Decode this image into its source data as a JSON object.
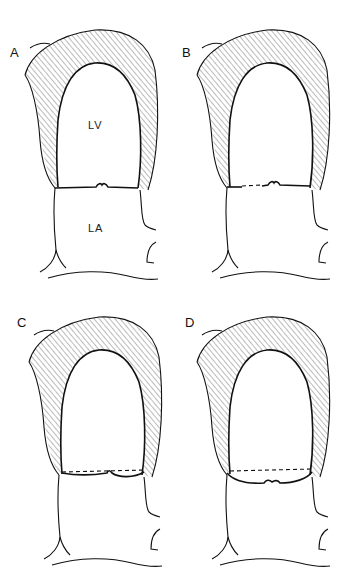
{
  "figure": {
    "panels": [
      {
        "id": "A",
        "label": "A",
        "chamber_labels": {
          "ventricle": "LV",
          "atrium": "LA"
        },
        "valve_line": "solid"
      },
      {
        "id": "B",
        "label": "B",
        "chamber_labels": {
          "ventricle": "",
          "atrium": ""
        },
        "valve_line": "solid"
      },
      {
        "id": "C",
        "label": "C",
        "chamber_labels": {
          "ventricle": "",
          "atrium": ""
        },
        "valve_line": "dashed with leaflets bulging below"
      },
      {
        "id": "D",
        "label": "D",
        "chamber_labels": {
          "ventricle": "",
          "atrium": ""
        },
        "valve_line": "dashed with leaflets prolapsing into atrium"
      }
    ],
    "wall_fill": "hatched",
    "stroke_color": "#111111",
    "background": "#ffffff"
  }
}
